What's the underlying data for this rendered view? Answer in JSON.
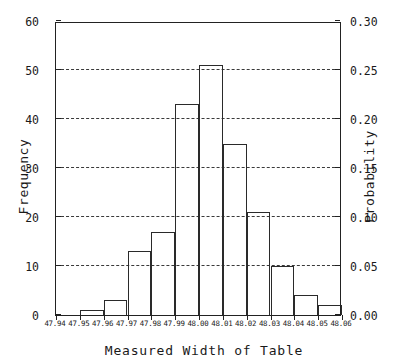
{
  "chart_data": {
    "type": "bar",
    "title": "",
    "xlabel": "Measured Width of Table",
    "ylabel": "Frequency",
    "ylabel_right": "Probability",
    "categories": [
      "47.95-47.96",
      "47.96-47.97",
      "47.97-47.98",
      "47.98-47.99",
      "47.99-48.00",
      "48.00-48.01",
      "48.01-48.02",
      "48.02-48.03",
      "48.03-48.04",
      "48.04-48.05",
      "48.05-48.06"
    ],
    "bin_edges": [
      47.95,
      47.96,
      47.97,
      47.98,
      47.99,
      48.0,
      48.01,
      48.02,
      48.03,
      48.04,
      48.05,
      48.06
    ],
    "values": [
      1,
      3,
      13,
      17,
      43,
      51,
      35,
      21,
      10,
      4,
      2
    ],
    "probabilities": [
      0.005,
      0.015,
      0.065,
      0.085,
      0.215,
      0.255,
      0.175,
      0.105,
      0.05,
      0.02,
      0.01
    ],
    "total_count": 200,
    "xlim": [
      47.94,
      48.06
    ],
    "ylim": [
      0,
      60
    ],
    "ylim_right": [
      0.0,
      0.3
    ],
    "xticks": [
      "47.94",
      "47.95",
      "47.96",
      "47.97",
      "47.98",
      "47.99",
      "48.00",
      "48.01",
      "48.02",
      "48.03",
      "48.04",
      "48.05",
      "48.06"
    ],
    "xtick_values": [
      47.94,
      47.95,
      47.96,
      47.97,
      47.98,
      47.99,
      48.0,
      48.01,
      48.02,
      48.03,
      48.04,
      48.05,
      48.06
    ],
    "yticks_left": [
      "0",
      "10",
      "20",
      "30",
      "40",
      "50",
      "60"
    ],
    "ytick_values_left": [
      0,
      10,
      20,
      30,
      40,
      50,
      60
    ],
    "yticks_right": [
      "0.00",
      "0.05",
      "0.10",
      "0.15",
      "0.20",
      "0.25",
      "0.30"
    ],
    "ytick_values_right": [
      0.0,
      0.05,
      0.1,
      0.15,
      0.2,
      0.25,
      0.3
    ],
    "gridlines_at": [
      10,
      20,
      30,
      40,
      50
    ],
    "grid": true,
    "grid_style": "dashed",
    "legend": null,
    "bar_edge_color": "#2a2a2a",
    "bar_fill_color": "transparent",
    "axis_color": "#222222",
    "background_color": "#ffffff"
  }
}
